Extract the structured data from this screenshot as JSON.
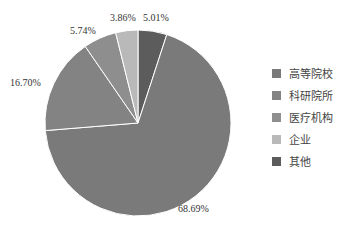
{
  "chart_data": {
    "type": "pie",
    "title": "",
    "categories": [
      "高等院校",
      "科研院所",
      "医疗机构",
      "企业",
      "其他"
    ],
    "values": [
      68.69,
      16.7,
      5.74,
      3.86,
      5.01
    ],
    "labels": [
      "68.69%",
      "16.70%",
      "5.74%",
      "3.86%",
      "5.01%"
    ],
    "colors": [
      "#7a7a7a",
      "#838383",
      "#8e8e8e",
      "#b9b9b9",
      "#5c5c5c"
    ],
    "legend_position": "right",
    "start_angle": "12 o'clock, clockwise starting with 其他"
  },
  "legend": [
    {
      "label": "高等院校",
      "color": "#7a7a7a"
    },
    {
      "label": "科研院所",
      "color": "#838383"
    },
    {
      "label": "医疗机构",
      "color": "#8e8e8e"
    },
    {
      "label": "企业",
      "color": "#b9b9b9"
    },
    {
      "label": "其他",
      "color": "#5c5c5c"
    }
  ]
}
